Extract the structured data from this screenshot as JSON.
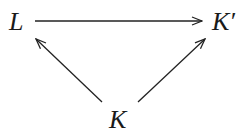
{
  "diagram": {
    "type": "commutative-triangle",
    "nodes": [
      {
        "id": "L",
        "label": "L"
      },
      {
        "id": "Kp",
        "label": "K′"
      },
      {
        "id": "K",
        "label": "K"
      }
    ],
    "edges": [
      {
        "from": "L",
        "to": "Kp",
        "direction": "right"
      },
      {
        "from": "K",
        "to": "L",
        "direction": "up-left"
      },
      {
        "from": "K",
        "to": "Kp",
        "direction": "up-right"
      }
    ],
    "colors": {
      "stroke": "#222222",
      "text": "#1a1a1a",
      "background": "#ffffff"
    }
  }
}
